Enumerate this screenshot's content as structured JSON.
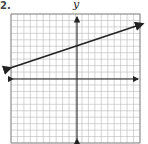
{
  "problem_number": "2.",
  "chart_data": {
    "type": "line",
    "title": "",
    "xlabel": "",
    "ylabel": "y",
    "xlim": [
      -10,
      10
    ],
    "ylim": [
      -10,
      10
    ],
    "grid": true,
    "series": [
      {
        "name": "line",
        "slope": 0.3333,
        "intercept": 5,
        "x": [
          -10,
          10
        ],
        "y": [
          1.67,
          8.33
        ],
        "arrows": "both"
      }
    ]
  }
}
